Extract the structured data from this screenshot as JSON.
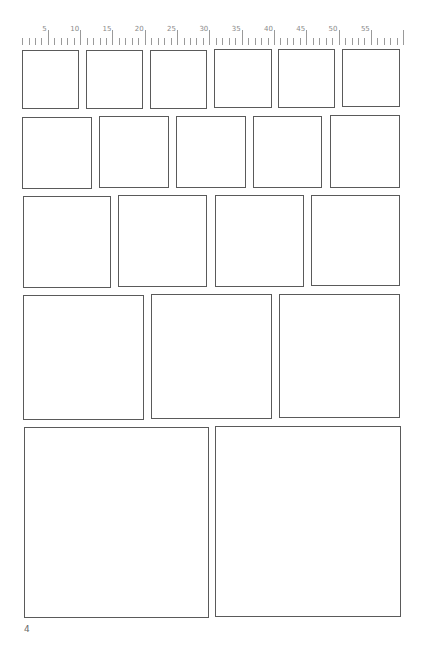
{
  "page": {
    "type": "storyboard-template",
    "page_number": "4",
    "line_color": "#5a5a5a",
    "ruler_color": "#9a9a9a"
  },
  "ruler": {
    "start_x": 22,
    "spacing": 6.46,
    "tick_count": 60,
    "labels": [
      "5",
      "10",
      "15",
      "20",
      "25",
      "30",
      "35",
      "40",
      "45",
      "50",
      "55"
    ]
  },
  "rows": [
    {
      "name": "row-1",
      "panels": [
        {
          "x": 22,
          "y": 50,
          "w": 57,
          "h": 59
        },
        {
          "x": 86,
          "y": 50,
          "w": 57,
          "h": 59
        },
        {
          "x": 150,
          "y": 50,
          "w": 57,
          "h": 59
        },
        {
          "x": 214,
          "y": 49,
          "w": 58,
          "h": 59
        },
        {
          "x": 278,
          "y": 49,
          "w": 57,
          "h": 59
        },
        {
          "x": 342,
          "y": 49,
          "w": 58,
          "h": 58
        }
      ]
    },
    {
      "name": "row-2",
      "panels": [
        {
          "x": 22,
          "y": 117,
          "w": 70,
          "h": 72
        },
        {
          "x": 99,
          "y": 116,
          "w": 70,
          "h": 72
        },
        {
          "x": 176,
          "y": 116,
          "w": 70,
          "h": 72
        },
        {
          "x": 253,
          "y": 116,
          "w": 69,
          "h": 72
        },
        {
          "x": 330,
          "y": 115,
          "w": 70,
          "h": 73
        }
      ]
    },
    {
      "name": "row-3",
      "panels": [
        {
          "x": 23,
          "y": 196,
          "w": 88,
          "h": 92
        },
        {
          "x": 118,
          "y": 195,
          "w": 89,
          "h": 92
        },
        {
          "x": 215,
          "y": 195,
          "w": 89,
          "h": 92
        },
        {
          "x": 311,
          "y": 195,
          "w": 89,
          "h": 91
        }
      ]
    },
    {
      "name": "row-4",
      "panels": [
        {
          "x": 23,
          "y": 295,
          "w": 121,
          "h": 125
        },
        {
          "x": 151,
          "y": 294,
          "w": 121,
          "h": 125
        },
        {
          "x": 279,
          "y": 294,
          "w": 121,
          "h": 124
        }
      ]
    },
    {
      "name": "row-5",
      "panels": [
        {
          "x": 24,
          "y": 427,
          "w": 185,
          "h": 191
        },
        {
          "x": 215,
          "y": 426,
          "w": 186,
          "h": 191
        }
      ]
    }
  ]
}
